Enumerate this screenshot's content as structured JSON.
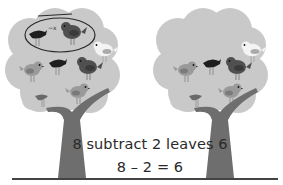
{
  "illustration": {
    "description": "Two trees with birds illustrating subtraction",
    "left_tree": {
      "birds_total": 8,
      "birds_circled": 2,
      "annotation": "circled-and-crossed-out"
    },
    "right_tree": {
      "birds_total": 6
    }
  },
  "caption": {
    "sentence": "8 subtract 2 leaves 6",
    "equation": "8 – 2 = 6"
  },
  "colors": {
    "canopy": "#c8c8c8",
    "trunk": "#6e6e6e",
    "text": "#2a2a2a",
    "rule": "#444444"
  }
}
